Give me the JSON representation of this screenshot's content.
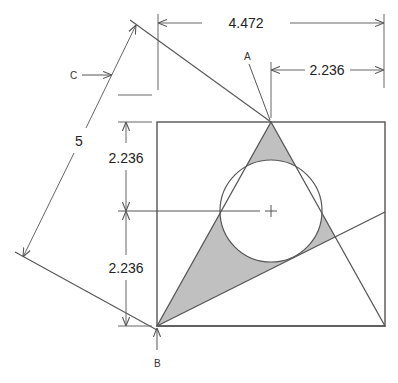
{
  "diagram": {
    "type": "geometric construction drawing",
    "dimensions": {
      "top_width": "4.472",
      "half_width": "2.236",
      "upper_height": "2.236",
      "lower_height": "2.236",
      "slant_length": "5"
    },
    "labels": {
      "point_a": "A",
      "point_b": "B",
      "point_c": "C"
    },
    "colors": {
      "line": "#555555",
      "fill": "#c0c0c0",
      "background": "#ffffff"
    },
    "elements": [
      "square",
      "isosceles triangle",
      "inscribed circle with center mark",
      "diagonal line from B",
      "shaded region between triangle, circle and diagonal"
    ]
  }
}
